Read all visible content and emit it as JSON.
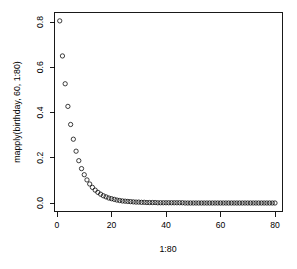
{
  "chart_data": {
    "type": "scatter",
    "title": "",
    "xlabel": "1:80",
    "ylabel": "mapply(birthday, 60, 1:80)",
    "xlim": [
      0,
      80
    ],
    "ylim": [
      0.0,
      0.82
    ],
    "grid": false,
    "legend": null,
    "point_style": "open-circle",
    "xticks": [
      0,
      20,
      40,
      60,
      80
    ],
    "xtick_labels": [
      "0",
      "20",
      "40",
      "60",
      "80"
    ],
    "yticks": [
      0.0,
      0.2,
      0.4,
      0.6,
      0.8
    ],
    "ytick_labels": [
      "0.0",
      "0.2",
      "0.4",
      "0.6",
      "0.8"
    ],
    "x": [
      1,
      2,
      3,
      4,
      5,
      6,
      7,
      8,
      9,
      10,
      11,
      12,
      13,
      14,
      15,
      16,
      17,
      18,
      19,
      20,
      21,
      22,
      23,
      24,
      25,
      26,
      27,
      28,
      29,
      30,
      31,
      32,
      33,
      34,
      35,
      36,
      37,
      38,
      39,
      40,
      41,
      42,
      43,
      44,
      45,
      46,
      47,
      48,
      49,
      50,
      51,
      52,
      53,
      54,
      55,
      56,
      57,
      58,
      59,
      60,
      61,
      62,
      63,
      64,
      65,
      66,
      67,
      68,
      69,
      70,
      71,
      72,
      73,
      74,
      75,
      76,
      77,
      78,
      79,
      80
    ],
    "y": [
      0.805,
      0.65,
      0.527,
      0.427,
      0.347,
      0.282,
      0.229,
      0.187,
      0.152,
      0.125,
      0.102,
      0.084,
      0.069,
      0.057,
      0.047,
      0.039,
      0.032,
      0.027,
      0.022,
      0.019,
      0.016,
      0.013,
      0.011,
      0.009,
      0.008,
      0.007,
      0.006,
      0.005,
      0.004,
      0.004,
      0.003,
      0.003,
      0.002,
      0.002,
      0.002,
      0.002,
      0.001,
      0.001,
      0.001,
      0.001,
      0.001,
      0.001,
      0.001,
      0.001,
      0.001,
      0.001,
      0.0,
      0.0,
      0.0,
      0.0,
      0.0,
      0.0,
      0.0,
      0.0,
      0.0,
      0.0,
      0.0,
      0.0,
      0.0,
      0.0,
      0.0,
      0.0,
      0.0,
      0.0,
      0.0,
      0.0,
      0.0,
      0.0,
      0.0,
      0.0,
      0.0,
      0.0,
      0.0,
      0.0,
      0.0,
      0.0,
      0.0,
      0.0,
      0.0,
      0.0
    ]
  },
  "plot": {
    "background_color": "#ffffff",
    "foreground_color": "#000000"
  }
}
